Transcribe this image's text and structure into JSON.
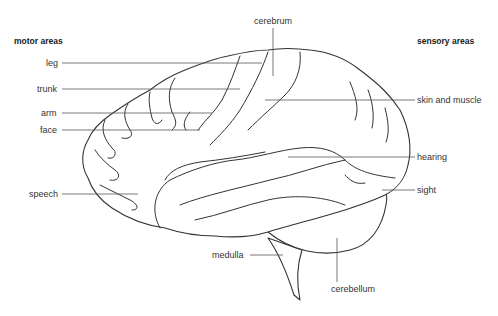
{
  "diagram": {
    "headings": {
      "motor": "motor areas",
      "sensory": "sensory areas"
    },
    "labels": {
      "cerebrum": "cerebrum",
      "leg": "leg",
      "trunk": "trunk",
      "arm": "arm",
      "face": "face",
      "speech": "speech",
      "skin_and_muscle": "skin and muscle",
      "hearing": "hearing",
      "sight": "sight",
      "medulla": "medulla",
      "cerebellum": "cerebellum"
    },
    "colors": {
      "line": "#333333",
      "leader": "#555555",
      "background": "#ffffff"
    }
  }
}
